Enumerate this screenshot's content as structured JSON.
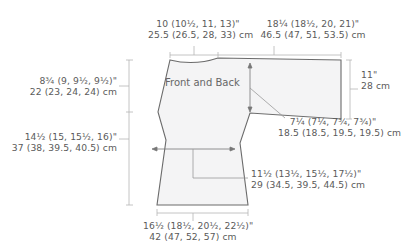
{
  "diagram": {
    "piece_label": "Front and Back",
    "colors": {
      "outline": "#6b6b6b",
      "fill": "#f4f4f5",
      "dimension_line": "#b5b5b5",
      "text": "#5a5a5a"
    },
    "measurements": {
      "neck_width": {
        "inches": "10 (10½, 11, 13)\"",
        "cm": "25.5 (26.5, 28, 33) cm"
      },
      "shoulder_sleeve_width": {
        "inches": "18¼ (18½, 20, 21)\"",
        "cm": "46.5 (47, 51, 53.5) cm"
      },
      "sleeve_cuff_depth": {
        "inches": "11\"",
        "cm": "28 cm"
      },
      "yoke_depth": {
        "inches": "8¾ (9, 9½, 9½)\"",
        "cm": "22 (23, 24, 24) cm"
      },
      "armhole_depth": {
        "inches": "7¼ (7¼, 7¾, 7¾)\"",
        "cm": "18.5 (18.5, 19.5, 19.5) cm"
      },
      "body_length": {
        "inches": "14½ (15, 15½, 16)\"",
        "cm": "37 (38, 39.5, 40.5) cm"
      },
      "waist_width": {
        "inches": "11½ (13½, 15½, 17½)\"",
        "cm": "29 (34.5, 39.5, 44.5) cm"
      },
      "hem_width": {
        "inches": "16½ (18½, 20½, 22½)\"",
        "cm": "42 (47, 52, 57) cm"
      }
    }
  }
}
